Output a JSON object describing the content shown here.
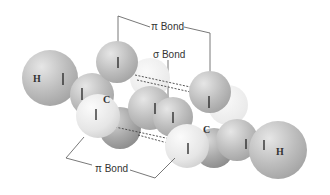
{
  "diagram": {
    "labels": {
      "pi_top": "π Bond",
      "sigma": "σ Bond",
      "pi_bottom": "π Bond",
      "atom_h_left": "H",
      "atom_h_right": "H",
      "atom_c_left": "C",
      "atom_c_right": "C"
    },
    "colors": {
      "sphere_dark": "#9a9a9a",
      "sphere_mid": "#c4c4c4",
      "sphere_light": "#ececec",
      "line": "#555555",
      "text": "#333333"
    }
  }
}
